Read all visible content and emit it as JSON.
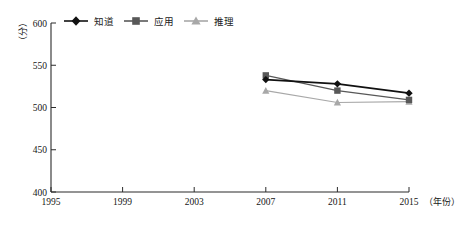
{
  "chart_data": {
    "type": "line",
    "title": "",
    "subtitle": "",
    "xlabel": "年份",
    "ylabel": "分",
    "x": [
      1995,
      1999,
      2003,
      2007,
      2011,
      2015
    ],
    "xtick_labels": [
      "1995",
      "1999",
      "2003",
      "2007",
      "2011",
      "2015"
    ],
    "xlim": [
      1995,
      2015
    ],
    "ylim": [
      400,
      600
    ],
    "ytick_labels": [
      "400",
      "450",
      "500",
      "550",
      "600"
    ],
    "ytick_values": [
      400,
      450,
      500,
      550,
      600
    ],
    "grid": false,
    "legend_position": "top-left",
    "series": [
      {
        "name": "知道",
        "marker": "diamond",
        "color": "#111111",
        "x": [
          2007,
          2011,
          2015
        ],
        "values": [
          533,
          528,
          517
        ]
      },
      {
        "name": "应用",
        "marker": "square",
        "color": "#585858",
        "x": [
          2007,
          2011,
          2015
        ],
        "values": [
          538,
          520,
          509
        ]
      },
      {
        "name": "推理",
        "marker": "triangle",
        "color": "#a8a8a8",
        "x": [
          2007,
          2011,
          2015
        ],
        "values": [
          520,
          506,
          507
        ]
      }
    ]
  },
  "axes": {
    "y_unit_label": "（分）",
    "x_unit_label": "（年份）",
    "y_ticks": [
      {
        "label": "600",
        "value": 600
      },
      {
        "label": "550",
        "value": 550
      },
      {
        "label": "500",
        "value": 500
      },
      {
        "label": "450",
        "value": 450
      },
      {
        "label": "400",
        "value": 400
      }
    ],
    "x_ticks": [
      {
        "label": "1995",
        "value": 1995
      },
      {
        "label": "1999",
        "value": 1999
      },
      {
        "label": "2003",
        "value": 2003
      },
      {
        "label": "2007",
        "value": 2007
      },
      {
        "label": "2011",
        "value": 2011
      },
      {
        "label": "2015",
        "value": 2015
      }
    ]
  },
  "legend": {
    "items": [
      {
        "label": "知道",
        "color": "#111111",
        "marker": "diamond"
      },
      {
        "label": "应用",
        "color": "#585858",
        "marker": "square"
      },
      {
        "label": "推理",
        "color": "#a8a8a8",
        "marker": "triangle"
      }
    ]
  },
  "colors": {
    "axis": "#2b2b2b",
    "series_know": "#111111",
    "series_apply": "#585858",
    "series_reason": "#a8a8a8",
    "background": "#ffffff"
  }
}
